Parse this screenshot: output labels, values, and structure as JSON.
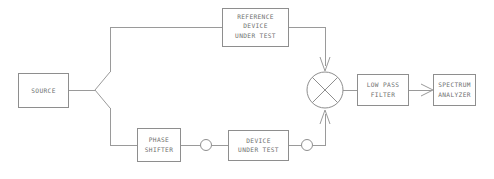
{
  "diagram": {
    "line_color": "#9a9a9a",
    "box_stroke_color": "#8e8e8e",
    "text_color": "#6f6f6f",
    "background_color": "#ffffff",
    "blocks": {
      "source": {
        "label_line1": "SOURCE"
      },
      "reference_dut": {
        "label_line1": "REFERENCE",
        "label_line2": "DEVICE",
        "label_line3": "UNDER TEST"
      },
      "phase_shifter": {
        "label_line1": "PHASE",
        "label_line2": "SHIFTER"
      },
      "device_under_test": {
        "label_line1": "DEVICE",
        "label_line2": "UNDER TEST"
      },
      "low_pass_filter": {
        "label_line1": "LOW PASS",
        "label_line2": "FILTER"
      },
      "spectrum_analyzer": {
        "label_line1": "SPECTRUM",
        "label_line2": "ANALYZER"
      },
      "mixer": {
        "symbol": "multiplier-x"
      }
    }
  }
}
